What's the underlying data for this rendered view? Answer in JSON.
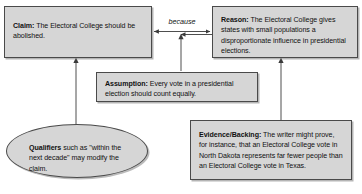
{
  "diagram": {
    "background_color": "#ffffff",
    "node_fill_color": "#d6d6d6",
    "node_border_color": "#4a4a4a",
    "text_color": "#111111"
  },
  "nodes": {
    "claim": {
      "label": "Claim:",
      "text": " The Electoral College should be abolished.",
      "shape": "rectangle"
    },
    "reason": {
      "label": "Reason:",
      "text": " The Electoral College gives states with small populations a disproportionate influence in presidential elections.",
      "shape": "rectangle"
    },
    "assumption": {
      "label": "Assumption:",
      "text": " Every vote in a presidential election should count equally.",
      "shape": "rectangle"
    },
    "qualifiers": {
      "label": "Qualifiers",
      "text": " such as \"within the next decade\" may modify the claim.",
      "shape": "ellipse"
    },
    "evidence": {
      "label": "Evidence/Backing:",
      "text": " The writer might prove, for instance, that an Electoral College vote in North Dakota represents far fewer people than an Electoral College vote in Texas.",
      "shape": "rectangle"
    }
  },
  "connectors": {
    "because": {
      "label": "because",
      "style": "italic",
      "arrow_type": "double-headed-horizontal"
    },
    "assumption_to_because": {
      "arrow_type": "single-headed-vertical-up"
    },
    "qualifiers_to_claim": {
      "arrow_type": "single-headed-vertical-up"
    },
    "evidence_to_reason": {
      "arrow_type": "single-headed-vertical-up"
    }
  }
}
